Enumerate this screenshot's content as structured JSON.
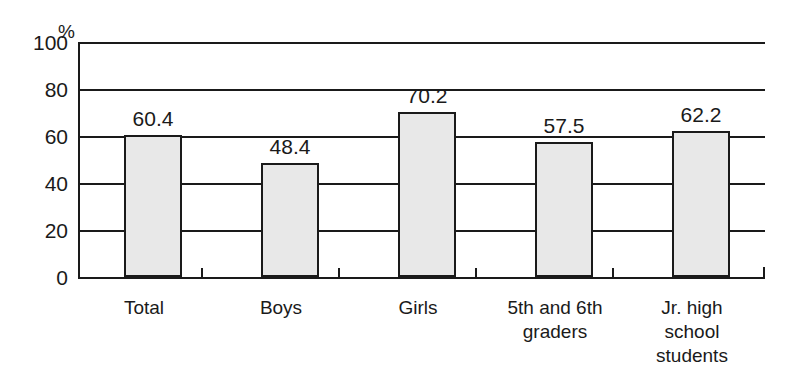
{
  "chart_data": {
    "type": "bar",
    "title": "",
    "subtitle": "",
    "xlabel": "",
    "ylabel": "",
    "unit_label": "%",
    "ylim": [
      0,
      100
    ],
    "yticks": [
      100,
      80,
      60,
      40,
      20,
      0
    ],
    "grid": true,
    "legend": false,
    "categories": [
      "Total",
      "Boys",
      "Girls",
      "5th and 6th graders",
      "Jr. high school students"
    ],
    "category_lines": [
      [
        "Total"
      ],
      [
        "Boys"
      ],
      [
        "Girls"
      ],
      [
        "5th and 6th",
        "graders"
      ],
      [
        "Jr. high",
        "school",
        "students"
      ]
    ],
    "values": [
      60.4,
      48.4,
      70.2,
      57.5,
      62.2
    ],
    "value_labels": [
      "60.4",
      "48.4",
      "70.2",
      "57.5",
      "62.2"
    ],
    "bar_fill_color": "#e8e8e8",
    "bar_border_color": "#1a1a1a",
    "axis_color": "#1a1a1a",
    "background_color": "#ffffff"
  },
  "axis": {
    "tick_0": "0",
    "tick_20": "20",
    "tick_40": "40",
    "tick_60": "60",
    "tick_80": "80",
    "tick_100": "100",
    "unit": "%"
  },
  "bars": [
    {
      "label": "Total",
      "value_text": "60.4"
    },
    {
      "label": "Boys",
      "value_text": "48.4"
    },
    {
      "label": "Girls",
      "value_text": "70.2"
    },
    {
      "label": "5th and 6th graders",
      "value_text": "57.5"
    },
    {
      "label": "Jr. high school students",
      "value_text": "62.2"
    }
  ],
  "cat_lines": {
    "c0_l0": "Total",
    "c1_l0": "Boys",
    "c2_l0": "Girls",
    "c3_l0": "5th and 6th",
    "c3_l1": "graders",
    "c4_l0": "Jr. high",
    "c4_l1": "school",
    "c4_l2": "students"
  }
}
